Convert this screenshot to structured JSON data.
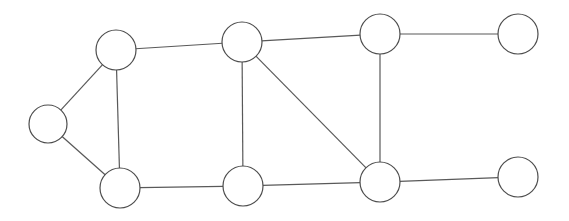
{
  "figure": {
    "kind": "undirected-graph-diagram",
    "width": 569,
    "height": 221,
    "background_color": "#ffffff",
    "node_count": 9,
    "edge_count": 12,
    "node_labels_present": false,
    "edge_labels_present": false,
    "title": "",
    "caption": ""
  },
  "style": {
    "edge_color": "#595959",
    "edge_width": 1.2,
    "node_stroke_color": "#4d4d4d",
    "node_stroke_width": 1.2,
    "node_fill_color": "#ffffff"
  },
  "graph": {
    "nodes": [
      {
        "id": "n1",
        "name": "node-left-apex",
        "label": "",
        "cx": 48,
        "cy": 124,
        "r": 19
      },
      {
        "id": "n2",
        "name": "node-upper-left",
        "label": "",
        "cx": 116,
        "cy": 50,
        "r": 20
      },
      {
        "id": "n3",
        "name": "node-lower-left",
        "label": "",
        "cx": 120,
        "cy": 188,
        "r": 20
      },
      {
        "id": "n4",
        "name": "node-upper-mid",
        "label": "",
        "cx": 242,
        "cy": 42,
        "r": 20
      },
      {
        "id": "n5",
        "name": "node-lower-mid",
        "label": "",
        "cx": 243,
        "cy": 186,
        "r": 20
      },
      {
        "id": "n6",
        "name": "node-upper-right-hub",
        "label": "",
        "cx": 380,
        "cy": 34,
        "r": 20
      },
      {
        "id": "n7",
        "name": "node-lower-right-hub",
        "label": "",
        "cx": 380,
        "cy": 182,
        "r": 20
      },
      {
        "id": "n8",
        "name": "node-upper-far-right",
        "label": "",
        "cx": 518,
        "cy": 34,
        "r": 20
      },
      {
        "id": "n9",
        "name": "node-lower-far-right",
        "label": "",
        "cx": 518,
        "cy": 177,
        "r": 20
      }
    ],
    "edges": [
      {
        "name": "edge-left-apex-upper-left",
        "source": "n1",
        "target": "n2",
        "label": ""
      },
      {
        "name": "edge-left-apex-lower-left",
        "source": "n1",
        "target": "n3",
        "label": ""
      },
      {
        "name": "edge-upper-left-lower-left",
        "source": "n2",
        "target": "n3",
        "label": ""
      },
      {
        "name": "edge-upper-left-upper-mid",
        "source": "n2",
        "target": "n4",
        "label": ""
      },
      {
        "name": "edge-upper-mid-lower-mid",
        "source": "n4",
        "target": "n5",
        "label": ""
      },
      {
        "name": "edge-upper-mid-upper-right-hub",
        "source": "n4",
        "target": "n6",
        "label": ""
      },
      {
        "name": "edge-upper-mid-lower-right-hub",
        "source": "n4",
        "target": "n7",
        "label": ""
      },
      {
        "name": "edge-lower-left-lower-mid",
        "source": "n3",
        "target": "n5",
        "label": ""
      },
      {
        "name": "edge-lower-mid-lower-right-hub",
        "source": "n5",
        "target": "n7",
        "label": ""
      },
      {
        "name": "edge-upper-right-hub-lower-right-hub",
        "source": "n6",
        "target": "n7",
        "label": ""
      },
      {
        "name": "edge-upper-right-hub-upper-far-right",
        "source": "n6",
        "target": "n8",
        "label": ""
      },
      {
        "name": "edge-lower-right-hub-lower-far-right",
        "source": "n7",
        "target": "n9",
        "label": ""
      }
    ]
  }
}
